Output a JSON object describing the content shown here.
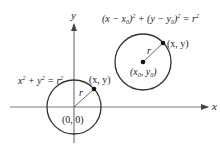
{
  "axes": {
    "x_label": "x",
    "y_label": "y"
  },
  "origin_circle": {
    "equation_parts": [
      "x",
      "2",
      " + y",
      "2",
      " = r",
      "2"
    ],
    "center_label": "(0, 0)",
    "point_label": "(x, y)",
    "radius_label": "r"
  },
  "shifted_circle": {
    "equation_parts": [
      "(x − x",
      "0",
      ")",
      "2",
      " + (y − y",
      "0",
      ")",
      "2",
      " = r",
      "2"
    ],
    "center_label_parts": [
      "(x",
      "0",
      ", y",
      "0",
      ")"
    ],
    "point_label": "(x, y)",
    "radius_label": "r"
  },
  "colors": {
    "axis": "#7a7a7a",
    "circle": "#333333",
    "radius": "#555555",
    "point": "#111111",
    "text": "#222222"
  }
}
